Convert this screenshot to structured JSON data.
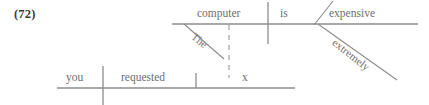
{
  "label": {
    "text": "(72)"
  },
  "colors": {
    "line": "#8c8c8c",
    "text": "#6e6e6e",
    "label_text": "#3b3b3b",
    "background": "#ffffff"
  },
  "diagram": {
    "type": "reed-kellogg-sentence-diagram",
    "clauses": [
      {
        "name": "main-clause",
        "baseline": {
          "x1": 172,
          "y": 24,
          "x2": 418
        },
        "words": [
          {
            "role": "subject",
            "text": "computer",
            "x": 197,
            "y": 8
          },
          {
            "role": "linking-verb",
            "text": "is",
            "x": 280,
            "y": 8
          },
          {
            "role": "predicate-adjective",
            "text": "expensive",
            "x": 329,
            "y": 8
          },
          {
            "role": "article-modifier",
            "text": "The",
            "modifies": "computer"
          },
          {
            "role": "adverb-modifier",
            "text": "extremely",
            "modifies": "expensive"
          }
        ],
        "dividers": [
          {
            "kind": "subject-verb",
            "x": 268,
            "y1": 2,
            "y2": 44
          },
          {
            "kind": "predicate-adjective-slant",
            "x1": 332,
            "y1": 2,
            "x2": 315,
            "y2": 24
          }
        ],
        "modifier_lines": [
          {
            "kind": "article-slant",
            "x1": 184,
            "y1": 24,
            "x2": 223,
            "y2": 58
          },
          {
            "kind": "adverb-slant",
            "x1": 318,
            "y1": 24,
            "x2": 396,
            "y2": 79
          }
        ]
      },
      {
        "name": "matrix-clause",
        "baseline": {
          "x1": 57,
          "y": 88,
          "x2": 295
        },
        "words": [
          {
            "role": "subject",
            "text": "you",
            "x": 66,
            "y": 72
          },
          {
            "role": "verb",
            "text": "requested",
            "x": 121,
            "y": 72
          },
          {
            "role": "direct-object",
            "text": "x",
            "x": 242,
            "y": 72
          }
        ],
        "dividers": [
          {
            "kind": "subject-verb",
            "x": 103,
            "y1": 66,
            "y2": 104
          },
          {
            "kind": "verb-object",
            "x": 196,
            "y1": 73,
            "y2": 88
          }
        ]
      }
    ],
    "connectors": [
      {
        "kind": "dashed-relative-link",
        "from": "direct-object-x",
        "to": "main-clause-baseline",
        "x": 229,
        "y1": 24,
        "y2": 78
      }
    ]
  }
}
